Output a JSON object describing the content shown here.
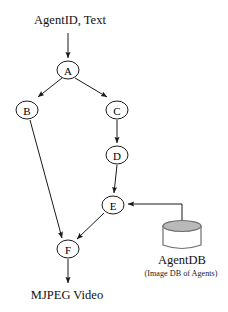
{
  "diagram": {
    "background_color": "#ffffff",
    "stroke_color": "#1a1a1a",
    "db_fill_color": "#b9b9b9",
    "db_stroke_color": "#6e6e6e",
    "input_label": "AgentID, Text",
    "output_label": "MJPEG Video",
    "datastore": {
      "name": "AgentDB",
      "caption": "(Image DB of Agents)"
    },
    "nodes": [
      {
        "id": "A",
        "label": "A",
        "cx": 68,
        "cy": 70,
        "rx": 11,
        "ry": 9
      },
      {
        "id": "B",
        "label": "B",
        "cx": 27,
        "cy": 110,
        "rx": 11,
        "ry": 9
      },
      {
        "id": "C",
        "label": "C",
        "cx": 117,
        "cy": 110,
        "rx": 11,
        "ry": 9
      },
      {
        "id": "D",
        "label": "D",
        "cx": 117,
        "cy": 155,
        "rx": 11,
        "ry": 9
      },
      {
        "id": "E",
        "label": "E",
        "cx": 113,
        "cy": 205,
        "rx": 11,
        "ry": 9
      },
      {
        "id": "F",
        "label": "F",
        "cx": 68,
        "cy": 249,
        "rx": 11,
        "ry": 9
      }
    ],
    "edges": [
      {
        "id": "input-to-a",
        "from": "input",
        "to": "A"
      },
      {
        "id": "a-to-b",
        "from": "A",
        "to": "B"
      },
      {
        "id": "a-to-c",
        "from": "A",
        "to": "C"
      },
      {
        "id": "c-to-d",
        "from": "C",
        "to": "D"
      },
      {
        "id": "d-to-e",
        "from": "D",
        "to": "E"
      },
      {
        "id": "e-to-f",
        "from": "E",
        "to": "F"
      },
      {
        "id": "b-to-f",
        "from": "B",
        "to": "F"
      },
      {
        "id": "f-to-output",
        "from": "F",
        "to": "output"
      },
      {
        "id": "db-to-e",
        "from": "AgentDB",
        "to": "E"
      }
    ]
  }
}
